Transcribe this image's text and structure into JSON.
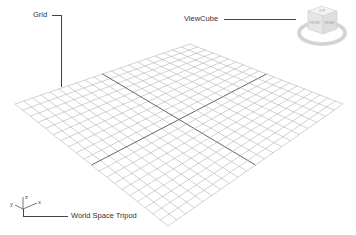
{
  "callouts": {
    "grid": {
      "label": "Grid"
    },
    "viewcube": {
      "label": "ViewCube"
    },
    "tripod": {
      "label": "World Space Tripod"
    }
  },
  "tripod_axes": {
    "x": "x",
    "y": "y",
    "z": "z"
  },
  "viewcube_faces": {
    "top": "TOP",
    "front": "FRONT",
    "right": "RIGHT"
  },
  "grid": {
    "divisions": 20,
    "corners": {
      "top": [
        190,
        44
      ],
      "right": [
        343,
        104
      ],
      "bottom": [
        168,
        226
      ],
      "left": [
        15,
        104
      ]
    },
    "line_color": "#b4b4b4",
    "axis_color": "#555555"
  },
  "colors": {
    "background": "#ffffff",
    "text": "#333333",
    "leader": "#444444"
  }
}
